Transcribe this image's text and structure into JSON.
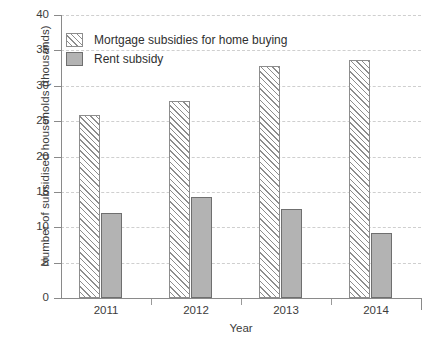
{
  "chart_data": {
    "type": "bar",
    "title": "",
    "xlabel": "Year",
    "ylabel": "Number of subsidised households (thousands)",
    "categories": [
      "2011",
      "2012",
      "2013",
      "2014"
    ],
    "series": [
      {
        "name": "Mortgage subsidies for home buying",
        "values": [
          25.9,
          27.9,
          32.8,
          33.6
        ],
        "fill": "diagonal-hatch",
        "color": "#ffffff",
        "edge_color": "#8d8d8d"
      },
      {
        "name": "Rent subsidy",
        "values": [
          12.0,
          14.3,
          12.6,
          9.2
        ],
        "fill": "solid",
        "color": "#b3b3b3",
        "edge_color": "#6f6f6f"
      }
    ],
    "ylim": [
      0,
      40
    ],
    "yticks": [
      0,
      5,
      10,
      15,
      20,
      25,
      30,
      35,
      40
    ],
    "ytick_labels": [
      "0",
      "5",
      "10",
      "15",
      "20",
      "25",
      "30",
      "35",
      "40"
    ],
    "grid": true,
    "grid_axis": "y",
    "grid_style": "dashed",
    "grid_color": "#cfcfcf",
    "legend_position": "upper-left",
    "background_color": "#ffffff"
  }
}
